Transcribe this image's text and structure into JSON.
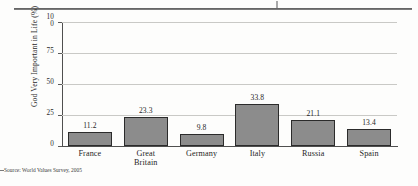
{
  "figure": {
    "source_note": "Source: World Values Survey, 2005",
    "top_rule": true
  },
  "chart_data": {
    "type": "bar",
    "title": "",
    "xlabel": "",
    "ylabel": "God Very Important in Life (%)",
    "categories": [
      "France",
      "Great Britain",
      "Germany",
      "Italy",
      "Russia",
      "Spain"
    ],
    "category_lines": [
      [
        "France"
      ],
      [
        "Great",
        "Britain"
      ],
      [
        "Germany"
      ],
      [
        "Italy"
      ],
      [
        "Russia"
      ],
      [
        "Spain"
      ]
    ],
    "values": [
      11.2,
      23.3,
      9.8,
      33.8,
      21.1,
      13.4
    ],
    "value_labels": [
      "11.2",
      "23.3",
      "9.8",
      "33.8",
      "21.1",
      "13.4"
    ],
    "ylim": [
      0,
      100
    ],
    "yticks": [
      0,
      25,
      50,
      75,
      100
    ],
    "ytick_labels": [
      "0",
      "25",
      "50",
      "75",
      "100"
    ],
    "ytick_label_lines": [
      [
        "0"
      ],
      [
        "25"
      ],
      [
        "50"
      ],
      [
        "75"
      ],
      [
        "10",
        "0"
      ]
    ],
    "grid": true,
    "grid_axis": "y",
    "legend": false,
    "colors": {
      "bar_fill": "#8c8c8c",
      "bar_edge": "#2b2b2b",
      "gridline": "#c9c9c6",
      "axis": "#4f4f4f",
      "text": "#1f1f1f",
      "background": "#fdfdfc"
    }
  }
}
